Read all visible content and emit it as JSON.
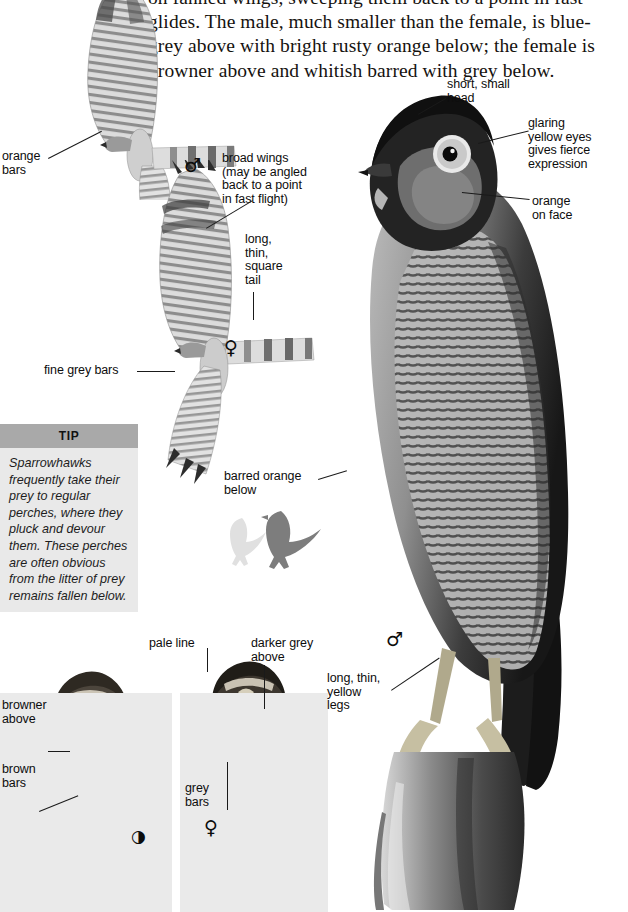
{
  "page": {
    "width": 628,
    "height": 912,
    "background": "#ffffff",
    "ink": "#0d0d0d"
  },
  "intro": {
    "text": "on fanned wings, sweeping them back to a point in fast glides. The male, much smaller than the female, is blue-grey above with bright rusty orange below; the female is browner above and whitish barred with grey below."
  },
  "tip": {
    "header": "TIP",
    "body": "Sparrowhawks frequently take their prey to regular perches, where they pluck and devour them. These perches are often obvious from the litter of prey remains fallen below.",
    "header_color": "#a9a9a9",
    "body_color": "#e9e9e9"
  },
  "callouts": {
    "orange_bars": "orange\nbars",
    "broad_wings": "broad wings\n(may be angled\nback to a point\nin fast flight)",
    "long_thin_square_tail": "long,\nthin,\nsquare\ntail",
    "fine_grey_bars": "fine grey bars",
    "barred_orange_below": "barred orange\nbelow",
    "short_small_head": "short, small\nhead",
    "glaring_yellow_eyes": "glaring\nyellow eyes\ngives fierce\nexpression",
    "orange_on_face": "orange\non face",
    "long_thin_yellow_legs": "long, thin,\nyellow\nlegs",
    "pale_line": "pale line",
    "darker_grey_above": "darker grey\nabove",
    "browner_above": "browner\nabove",
    "brown_bars": "brown\nbars",
    "grey_bars": "grey\nbars"
  },
  "symbols": {
    "male": "♂",
    "female": "♀",
    "juvenile": "◑"
  },
  "figures": [
    {
      "name": "male-in-flight-upper",
      "sex": "male",
      "view": "underside-flight"
    },
    {
      "name": "female-in-flight",
      "sex": "female",
      "view": "underside-flight"
    },
    {
      "name": "male-perched-main",
      "sex": "male",
      "view": "perched-photo"
    },
    {
      "name": "juvenile-perched",
      "sex": "juvenile",
      "view": "perched-photo"
    },
    {
      "name": "female-perched",
      "sex": "female",
      "view": "perched-photo"
    },
    {
      "name": "silhouette-pale",
      "sex": "",
      "view": "silhouette"
    },
    {
      "name": "silhouette-dark",
      "sex": "",
      "view": "silhouette"
    }
  ]
}
